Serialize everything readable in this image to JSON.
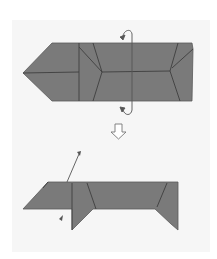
{
  "diagram": {
    "type": "origami-instruction",
    "steps": [
      {
        "name": "step-before",
        "description": "Folded strip with pointed left end; valley-fold in half along the horizontal midline (rotate arrows)"
      },
      {
        "name": "step-after",
        "description": "Folded model in profile with two legs and raised head"
      }
    ],
    "colors": {
      "paper": "#7a7a7a",
      "crease": "#3e3e3e",
      "background": "#f6f6f6",
      "arrow": "#555555"
    },
    "symbols": [
      "fold-over-arrow-top",
      "fold-over-arrow-bottom",
      "next-step-arrow",
      "lift-arrow",
      "small-arrow"
    ]
  }
}
